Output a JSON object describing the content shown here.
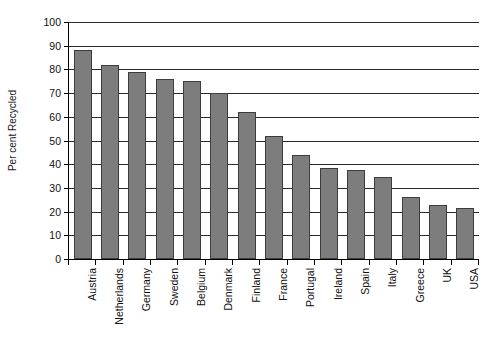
{
  "chart_data": {
    "type": "bar",
    "title": "",
    "xlabel": "",
    "ylabel": "Per cent Recycled",
    "ylim": [
      0,
      100
    ],
    "ytick_step": 10,
    "grid": true,
    "legend": false,
    "bar_color": "#7d7d7d",
    "bar_edge_color": "#3d3d3d",
    "axis_color": "#000000",
    "categories": [
      "Austria",
      "Netherlands",
      "Germany",
      "Sweden",
      "Belgium",
      "Denmark",
      "Finland",
      "France",
      "Portugal",
      "Ireland",
      "Spain",
      "Italy",
      "Greece",
      "UK",
      "USA"
    ],
    "values": [
      88,
      82,
      79,
      76,
      75,
      70,
      62,
      52,
      44,
      38.5,
      37.5,
      34.5,
      26,
      23,
      21.5
    ],
    "yticks": [
      0,
      10,
      20,
      30,
      40,
      50,
      60,
      70,
      80,
      90,
      100
    ],
    "ytick_labels": [
      "0",
      "10",
      "20",
      "30",
      "40",
      "50",
      "60",
      "70",
      "80",
      "90",
      "100"
    ]
  }
}
